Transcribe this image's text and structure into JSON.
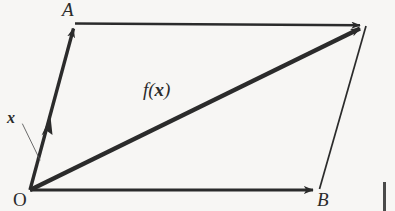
{
  "figure": {
    "background_color": "#f7f6f4",
    "stroke_color": "#2b2b2b",
    "labels": {
      "vertex_a": "A",
      "vertex_b": "B",
      "origin": "O",
      "input_vector": "x",
      "output_vector_prefix": "f(",
      "output_vector_arg": "x",
      "output_vector_suffix": ")"
    },
    "geometry": {
      "origin": [
        30,
        190
      ],
      "vertex_a": [
        75,
        24
      ],
      "vertex_b": [
        318,
        190
      ],
      "vertex_c": [
        366,
        26
      ],
      "arrows": [
        {
          "name": "vector-oa",
          "from": [
            30,
            190
          ],
          "to": [
            75,
            24
          ],
          "weight": "thick"
        },
        {
          "name": "vector-ob",
          "from": [
            30,
            190
          ],
          "to": [
            318,
            190
          ],
          "weight": "thick"
        },
        {
          "name": "vector-fx",
          "from": [
            30,
            190
          ],
          "to": [
            366,
            26
          ],
          "weight": "thick"
        },
        {
          "name": "edge-a-to-c",
          "from": [
            75,
            23
          ],
          "to": [
            366,
            25
          ],
          "weight": "medium"
        },
        {
          "name": "edge-b-to-c",
          "from": [
            319,
            189
          ],
          "to": [
            366,
            27
          ],
          "weight": "thin"
        }
      ],
      "leader_line": {
        "from": [
          22,
          124
        ],
        "to": [
          40,
          160
        ]
      },
      "mid_arrow_on_oa": [
        48,
        126
      ]
    }
  }
}
